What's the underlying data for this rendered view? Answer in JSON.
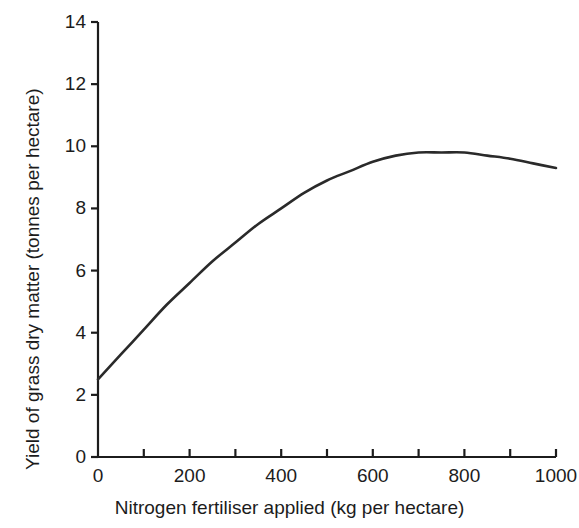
{
  "chart_data": {
    "type": "line",
    "title": "",
    "xlabel": "Nitrogen fertiliser applied (kg per hectare)",
    "ylabel": "Yield of grass dry matter (tonnes per hectare)",
    "xlim": [
      0,
      1000
    ],
    "ylim": [
      0,
      14
    ],
    "grid": false,
    "legend": "none",
    "x_tick_labels": [
      "0",
      "200",
      "400",
      "600",
      "800",
      "1000"
    ],
    "x_tick_values": [
      0,
      200,
      400,
      600,
      800,
      1000
    ],
    "x_minor_tick_values": [
      100,
      300,
      500,
      700,
      900
    ],
    "y_tick_labels": [
      "0",
      "2",
      "4",
      "6",
      "8",
      "10",
      "12",
      "14"
    ],
    "y_tick_values": [
      0,
      2,
      4,
      6,
      8,
      10,
      12,
      14
    ],
    "series": [
      {
        "name": "Grass dry matter yield response",
        "color": "#2a2a2a",
        "x": [
          0,
          50,
          100,
          150,
          200,
          250,
          300,
          350,
          400,
          450,
          500,
          550,
          600,
          650,
          700,
          750,
          800,
          850,
          900,
          950,
          1000
        ],
        "y": [
          2.5,
          3.3,
          4.1,
          4.9,
          5.6,
          6.3,
          6.9,
          7.5,
          8.0,
          8.5,
          8.9,
          9.2,
          9.5,
          9.7,
          9.8,
          9.8,
          9.8,
          9.7,
          9.6,
          9.45,
          9.3
        ]
      }
    ],
    "annotations": []
  }
}
